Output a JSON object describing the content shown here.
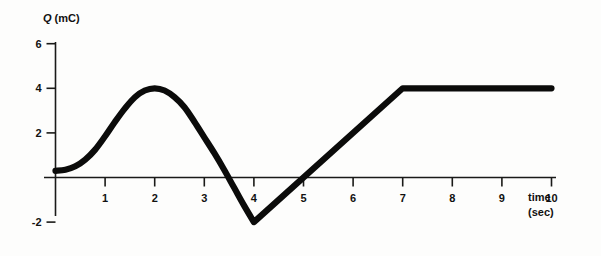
{
  "chart_data": {
    "type": "line",
    "title": "",
    "subtitle": "",
    "xlabel_line1": "time",
    "xlabel_line2": "(sec)",
    "ylabel_symbol": "Q",
    "ylabel_units": "(mC)",
    "ylabel_full": "Q (mC)",
    "xlabel_full": "time (sec)",
    "x_ticks": [
      1,
      2,
      3,
      4,
      5,
      6,
      7,
      8,
      9,
      10
    ],
    "x_tick_labels": [
      "1",
      "2",
      "3",
      "4",
      "5",
      "6",
      "7",
      "8",
      "9",
      "10"
    ],
    "y_ticks": [
      -2,
      2,
      4,
      6
    ],
    "y_tick_labels": [
      "-2",
      "2",
      "4",
      "6"
    ],
    "xlim": [
      0,
      10.1
    ],
    "ylim": [
      -2.8,
      6.9
    ],
    "grid": false,
    "legend": null,
    "legend_position": "none",
    "series": [
      {
        "name": "Q(t)",
        "color": "#0b0b0a",
        "linewidth": 6.2,
        "x": [
          0.0,
          0.2,
          0.4,
          0.6,
          0.8,
          1.0,
          1.2,
          1.4,
          1.6,
          1.8,
          2.0,
          2.2,
          2.4,
          2.6,
          2.8,
          3.0,
          3.2,
          3.4,
          3.6,
          3.8,
          4.0,
          4.5,
          5.0,
          5.5,
          6.0,
          6.5,
          7.0,
          7.5,
          8.0,
          8.5,
          9.0,
          9.5,
          10.0
        ],
        "values": [
          0.3,
          0.35,
          0.5,
          0.8,
          1.25,
          1.85,
          2.5,
          3.1,
          3.6,
          3.9,
          4.0,
          3.9,
          3.6,
          3.15,
          2.5,
          1.8,
          1.1,
          0.35,
          -0.45,
          -1.25,
          -2.0,
          -1.0,
          0.0,
          1.0,
          2.0,
          3.0,
          4.0,
          4.0,
          4.0,
          4.0,
          4.0,
          4.0,
          4.0
        ]
      }
    ],
    "annotations": [
      {
        "label": "peak",
        "x": 2.0,
        "y": 4.0
      },
      {
        "label": "minimum",
        "x": 4.0,
        "y": -2.0
      },
      {
        "label": "zero-crossing-down",
        "x": 3.5,
        "y": 0.0
      },
      {
        "label": "zero-crossing-up",
        "x": 5.0,
        "y": 0.0
      },
      {
        "label": "plateau-start",
        "x": 7.0,
        "y": 4.0
      },
      {
        "label": "plateau-end",
        "x": 10.0,
        "y": 4.0
      },
      {
        "label": "start",
        "x": 0.0,
        "y": 0.3
      }
    ]
  }
}
